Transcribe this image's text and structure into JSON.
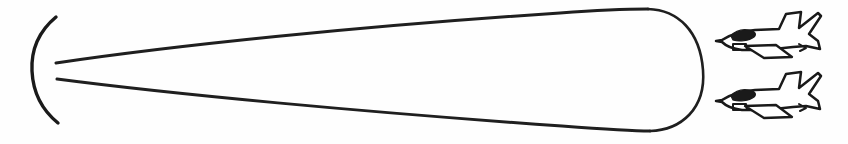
{
  "figure": {
    "kind": "line-art-diagram",
    "title": "",
    "caption": "",
    "background_color": "#fefefe",
    "ink_color": "#1a1a1a",
    "canvas": {
      "width": 848,
      "height": 144
    }
  },
  "elements": {
    "antenna": {
      "name": "antenna-arc",
      "description": "curved reflector arc opening to the right",
      "top_point": {
        "x": 56,
        "y": 17
      },
      "bottom_point": {
        "x": 58,
        "y": 123
      },
      "apex_point": {
        "x": 34,
        "y": 70
      },
      "stroke_width": 3.4
    },
    "beam": {
      "name": "beam-cone",
      "description": "radar beam widening left to right with rounded right cap",
      "origin_upper": {
        "x": 56,
        "y": 63
      },
      "origin_lower": {
        "x": 57,
        "y": 79
      },
      "far_upper": {
        "x": 648,
        "y": 9
      },
      "far_lower": {
        "x": 650,
        "y": 131
      },
      "cap_right_x": 706,
      "stroke_width": 3.0
    },
    "aircraft": [
      {
        "name": "jet-upper",
        "label": "",
        "heading": "left",
        "nose": {
          "x": 722,
          "y": 40
        },
        "tail_tip": {
          "x": 820,
          "y": 14
        },
        "bbox": {
          "x": 718,
          "y": 10,
          "width": 104,
          "height": 54
        }
      },
      {
        "name": "jet-lower",
        "label": "",
        "heading": "left",
        "nose": {
          "x": 722,
          "y": 100
        },
        "tail_tip": {
          "x": 820,
          "y": 74
        },
        "bbox": {
          "x": 718,
          "y": 70,
          "width": 104,
          "height": 54
        }
      }
    ]
  },
  "labels": {
    "text_items": []
  }
}
